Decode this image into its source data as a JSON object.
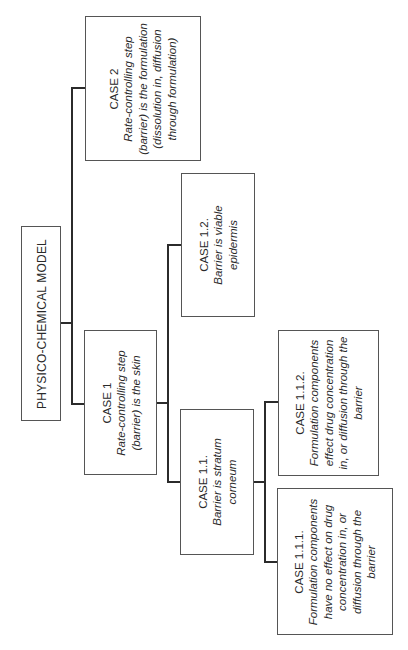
{
  "diagram": {
    "type": "tree",
    "orientation": "rotated -90deg",
    "root": {
      "label": "PHYSICO-CHEMICAL MODEL"
    },
    "nodes": {
      "case2": {
        "title": "CASE 2",
        "description": "Rate-controlling step (barrier) is the formulation (dissolution in, diffusion through formulation)"
      },
      "case1": {
        "title": "CASE 1",
        "description": "Rate-controlling step (barrier) is the skin"
      },
      "case12": {
        "title": "CASE 1.2.",
        "description": "Barrier is viable epidermis"
      },
      "case11": {
        "title": "CASE 1.1.",
        "description": "Barrier is stratum corneum"
      },
      "case112": {
        "title": "CASE 1.1.2.",
        "description": "Formulation components effect drug concentration in, or diffusion through the barrier"
      },
      "case111": {
        "title": "CASE 1.1.1.",
        "description": "Formulation components have no effect on drug concentration in, or diffusion through the barrier"
      }
    },
    "edges": [
      [
        "root",
        "case2"
      ],
      [
        "root",
        "case1"
      ],
      [
        "case1",
        "case12"
      ],
      [
        "case1",
        "case11"
      ],
      [
        "case11",
        "case112"
      ],
      [
        "case11",
        "case111"
      ]
    ]
  }
}
